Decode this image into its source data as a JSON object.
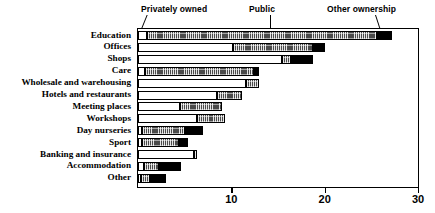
{
  "chart_data": {
    "type": "bar",
    "subtype": "stacked-horizontal-bar",
    "title": "",
    "xlabel": "",
    "ylabel": "",
    "xlim": [
      0,
      30
    ],
    "xticks": [
      0,
      10,
      20,
      30
    ],
    "xtick_labels": [
      "",
      "10",
      "20",
      "30"
    ],
    "grid": false,
    "legend_position": "above-plot-callouts",
    "orientation": "horizontal",
    "stacked": true,
    "categories": [
      "Education",
      "Offices",
      "Shops",
      "Care",
      "Wholesale and warehousing",
      "Hotels and restaurants",
      "Meeting places",
      "Workshops",
      "Day nurseries",
      "Sport",
      "Banking and insurance",
      "Accommodation",
      "Other"
    ],
    "series": [
      {
        "name": "Privately owned",
        "color": "#ffffff",
        "values": [
          1.0,
          10.2,
          15.4,
          0.7,
          11.6,
          8.5,
          4.5,
          6.3,
          0.4,
          0.4,
          6.0,
          0.6,
          0.3
        ]
      },
      {
        "name": "Public",
        "color": "#4a4a4a",
        "values": [
          24.6,
          8.6,
          1.0,
          11.7,
          1.4,
          2.6,
          4.5,
          3.0,
          4.6,
          4.0,
          0.3,
          1.6,
          1.0
        ]
      },
      {
        "name": "Other ownership",
        "color": "#000000",
        "values": [
          1.6,
          1.2,
          2.4,
          0.6,
          0.0,
          0.0,
          0.0,
          0.0,
          2.0,
          1.0,
          0.0,
          2.4,
          1.7
        ]
      }
    ],
    "totals": [
      27.2,
      20.0,
      18.8,
      13.0,
      13.0,
      11.1,
      9.0,
      9.3,
      7.0,
      5.4,
      6.3,
      4.6,
      3.0
    ]
  },
  "callouts": [
    {
      "label": "Privately owned",
      "name": "callout-privately-owned"
    },
    {
      "label": "Public",
      "name": "callout-public"
    },
    {
      "label": "Other ownership",
      "name": "callout-other-ownership"
    }
  ]
}
